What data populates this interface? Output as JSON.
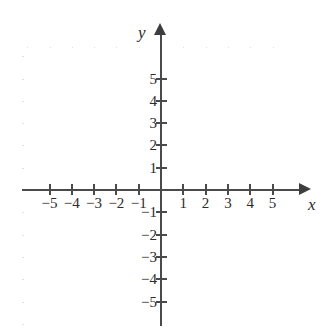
{
  "chart_data": {
    "type": "scatter",
    "title": "",
    "subtitle": "",
    "xlabel": "x",
    "ylabel": "y",
    "xlim": [
      -6,
      6
    ],
    "ylim": [
      -6,
      6
    ],
    "grid": true,
    "legend": null,
    "series": [],
    "x": [],
    "values": [],
    "annotations": [],
    "x_ticks": [
      "-5",
      "-4",
      "-3",
      "-2",
      "-1",
      "1",
      "2",
      "3",
      "4",
      "5"
    ],
    "y_ticks": [
      "5",
      "4",
      "3",
      "2",
      "1",
      "-1",
      "-2",
      "-3",
      "-4",
      "-5"
    ],
    "x_tick_values": [
      -5,
      -4,
      -3,
      -2,
      -1,
      1,
      2,
      3,
      4,
      5
    ],
    "y_tick_values": [
      5,
      4,
      3,
      2,
      1,
      -1,
      -2,
      -3,
      -4,
      -5
    ],
    "origin_label": "",
    "arrow_x": "right",
    "arrow_y": "up",
    "colors": {
      "axis": "#4a4a4a",
      "grid": "#e2dede",
      "text": "#2b2b2b",
      "background": "#ffffff"
    }
  },
  "axes": {
    "x_name": "x",
    "y_name": "y"
  }
}
